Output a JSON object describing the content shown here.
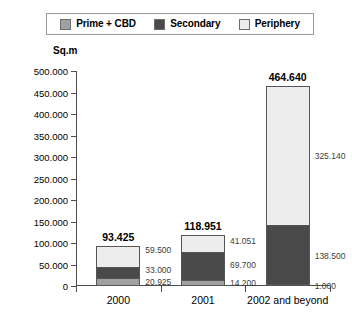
{
  "legend": {
    "entries": [
      {
        "label": "Prime + CBD",
        "color": "#a0a0a0"
      },
      {
        "label": "Secondary",
        "color": "#4a4a4a"
      },
      {
        "label": "Periphery",
        "color": "#ededed"
      }
    ]
  },
  "chart_data": {
    "type": "bar",
    "title": "",
    "subtitle": "",
    "stacked": true,
    "xlabel": "",
    "ylabel": "Sq.m",
    "ylim": [
      0,
      500000
    ],
    "ytick_labels": [
      "500.000",
      "450.000",
      "400.000",
      "350.000",
      "300.000",
      "250.000",
      "200.000",
      "150.000",
      "100.000",
      "50.000",
      "0"
    ],
    "ytick_values": [
      500000,
      450000,
      400000,
      350000,
      300000,
      250000,
      200000,
      150000,
      100000,
      50000,
      0
    ],
    "grid": false,
    "legend_position": "top",
    "categories": [
      "2000",
      "2001",
      "2002 and beyond"
    ],
    "series": [
      {
        "name": "Prime + CBD",
        "color": "#a0a0a0",
        "values": [
          20925,
          14200,
          1000
        ],
        "labels": [
          "20.925",
          "14.200",
          "1.000"
        ]
      },
      {
        "name": "Secondary",
        "color": "#4a4a4a",
        "values": [
          33000,
          69700,
          138500
        ],
        "labels": [
          "33.000",
          "69.700",
          "138.500"
        ]
      },
      {
        "name": "Periphery",
        "color": "#ededed",
        "values": [
          59500,
          41051,
          325140
        ],
        "labels": [
          "59.500",
          "41.051",
          "325.140"
        ]
      }
    ],
    "totals": [
      93425,
      118951,
      464640
    ],
    "total_labels": [
      "93.425",
      "118.951",
      "464.640"
    ]
  }
}
